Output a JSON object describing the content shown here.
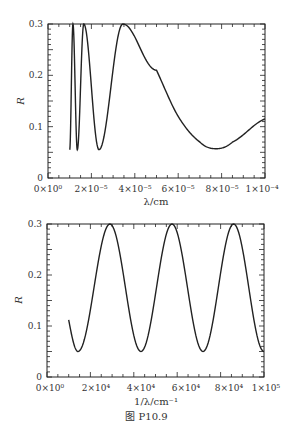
{
  "chart_data": [
    {
      "type": "line",
      "title": "",
      "xlabel": "λ/cm",
      "ylabel": "R",
      "xlim": [
        0,
        0.0001
      ],
      "ylim": [
        0,
        0.3
      ],
      "xticks": [
        "0×10⁰",
        "2×10⁻⁵",
        "4×10⁻⁵",
        "6×10⁻⁵",
        "8×10⁻⁵",
        "1×10⁻⁴"
      ],
      "yticks": [
        "0",
        "0.1",
        "0.2",
        "0.3"
      ],
      "grid": false,
      "series": [
        {
          "name": "R(λ)",
          "x": [
            1e-05,
            1.15e-05,
            1.35e-05,
            1.65e-05,
            2.35e-05,
            3.45e-05,
            5e-05,
            6e-05,
            7e-05,
            7.75e-05,
            8.5e-05,
            0.0001
          ],
          "y": [
            0.055,
            0.3,
            0.055,
            0.3,
            0.055,
            0.3,
            0.21,
            0.12,
            0.07,
            0.057,
            0.07,
            0.115
          ]
        }
      ]
    },
    {
      "type": "line",
      "title": "",
      "xlabel": "1/λ/cm⁻¹",
      "ylabel": "R",
      "xlim": [
        0,
        100000
      ],
      "ylim": [
        0,
        0.3
      ],
      "xticks": [
        "0×10⁰",
        "2×10⁴",
        "4×10⁴",
        "6×10⁴",
        "8×10⁴",
        "1×10⁵"
      ],
      "yticks": [
        "0",
        "0.1",
        "0.2",
        "0.3"
      ],
      "grid": false,
      "series": [
        {
          "name": "R(1/λ)",
          "x": [
            10000,
            14300,
            29000,
            43300,
            57600,
            71900,
            86000,
            100000
          ],
          "y": [
            0.112,
            0.05,
            0.3,
            0.05,
            0.3,
            0.05,
            0.3,
            0.05
          ]
        }
      ]
    }
  ],
  "caption": "图 P10.9",
  "top": {
    "ylabel": "R",
    "xlabel": "λ/cm",
    "yticks": [
      "0",
      "0.1",
      "0.2",
      "0.3"
    ],
    "xticks": [
      "0×10⁰",
      "2×10⁻⁵",
      "4×10⁻⁵",
      "6×10⁻⁵",
      "8×10⁻⁵",
      "1×10⁻⁴"
    ]
  },
  "bottom": {
    "ylabel": "R",
    "xlabel": "1/λ/cm⁻¹",
    "yticks": [
      "0",
      "0.1",
      "0.2",
      "0.3"
    ],
    "xticks": [
      "0×10⁰",
      "2×10⁴",
      "4×10⁴",
      "6×10⁴",
      "8×10⁴",
      "1×10⁵"
    ]
  }
}
